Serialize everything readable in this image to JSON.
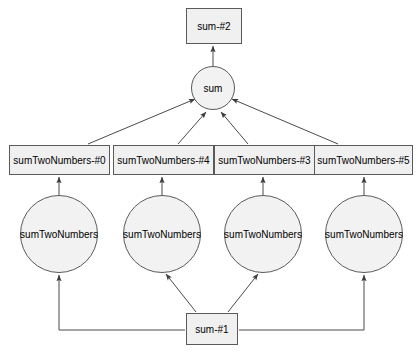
{
  "diagram": {
    "type": "call-graph",
    "background_color": "#ffffff",
    "node_fill_color": "#f0f0f0",
    "node_border_color": "#5a5a5a",
    "edge_color": "#4a4a4a",
    "nodes": {
      "top_box": {
        "label": "sum-#2",
        "shape": "rectangle",
        "x": 186,
        "y": 8,
        "w": 56,
        "h": 36
      },
      "sum_circle": {
        "label": "sum",
        "shape": "circle",
        "cx": 213,
        "cy": 88,
        "r": 22
      },
      "middle_boxes": [
        {
          "label": "sumTwoNumbers-#0",
          "shape": "rectangle",
          "x": 9,
          "y": 145,
          "w": 101,
          "h": 30
        },
        {
          "label": "sumTwoNumbers-#4",
          "shape": "rectangle",
          "x": 113,
          "y": 145,
          "w": 101,
          "h": 30
        },
        {
          "label": "sumTwoNumbers-#3",
          "shape": "rectangle",
          "x": 214,
          "y": 145,
          "w": 101,
          "h": 30
        },
        {
          "label": "sumTwoNumbers-#5",
          "shape": "rectangle",
          "x": 314,
          "y": 145,
          "w": 99,
          "h": 30
        }
      ],
      "bottom_circles": [
        {
          "label": "sumTwoNumbers",
          "shape": "circle",
          "cx": 59,
          "cy": 234,
          "r": 39
        },
        {
          "label": "sumTwoNumbers",
          "shape": "circle",
          "cx": 162,
          "cy": 234,
          "r": 39
        },
        {
          "label": "sumTwoNumbers",
          "shape": "circle",
          "cx": 263,
          "cy": 234,
          "r": 39
        },
        {
          "label": "sumTwoNumbers",
          "shape": "circle",
          "cx": 364,
          "cy": 234,
          "r": 39
        }
      ],
      "bottom_box": {
        "label": "sum-#1",
        "shape": "rectangle",
        "x": 186,
        "y": 313,
        "w": 52,
        "h": 32
      }
    },
    "edges": [
      {
        "from": "sum_circle",
        "to": "top_box",
        "style": "straight-arrow"
      },
      {
        "from": "sumTwoNumbers-#0",
        "to": "sum_circle",
        "style": "diagonal-arrow"
      },
      {
        "from": "sumTwoNumbers-#4",
        "to": "sum_circle",
        "style": "diagonal-arrow"
      },
      {
        "from": "sumTwoNumbers-#3",
        "to": "sum_circle",
        "style": "diagonal-arrow"
      },
      {
        "from": "sumTwoNumbers-#5",
        "to": "sum_circle",
        "style": "diagonal-arrow"
      },
      {
        "from": "circle-1",
        "to": "sumTwoNumbers-#0",
        "style": "vertical-arrow"
      },
      {
        "from": "circle-2",
        "to": "sumTwoNumbers-#4",
        "style": "vertical-arrow"
      },
      {
        "from": "circle-3",
        "to": "sumTwoNumbers-#3",
        "style": "vertical-arrow"
      },
      {
        "from": "circle-4",
        "to": "sumTwoNumbers-#5",
        "style": "vertical-arrow"
      },
      {
        "from": "sum-#1",
        "to": "circle-1",
        "style": "orthogonal-arrow"
      },
      {
        "from": "sum-#1",
        "to": "circle-2",
        "style": "diagonal-arrow"
      },
      {
        "from": "sum-#1",
        "to": "circle-3",
        "style": "diagonal-arrow"
      },
      {
        "from": "sum-#1",
        "to": "circle-4",
        "style": "orthogonal-arrow"
      }
    ]
  }
}
